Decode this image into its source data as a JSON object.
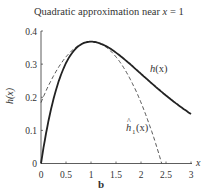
{
  "chart_data": {
    "type": "line",
    "title": "Quadratic approximation near x = 1",
    "title_prefix": "Quadratic approximation near ",
    "title_var": "x",
    "title_suffix": " = 1",
    "xlabel": "x",
    "ylabel": "h(x)",
    "panel_label": "b",
    "xlim": [
      0,
      3
    ],
    "ylim": [
      0,
      0.4
    ],
    "xticks": [
      "0",
      "0.5",
      "1",
      "1.5",
      "2",
      "2.5",
      "3"
    ],
    "yticks": [
      "0",
      "0.1",
      "0.2",
      "0.3",
      "0.4"
    ],
    "grid": false,
    "legend": "inline labels",
    "series": [
      {
        "name": "h(x)",
        "label": "h(x)",
        "style": "solid",
        "x": [
          0,
          0.1,
          0.2,
          0.3,
          0.4,
          0.5,
          0.6,
          0.7,
          0.8,
          0.9,
          1.0,
          1.2,
          1.4,
          1.6,
          1.8,
          2.0,
          2.2,
          2.4,
          2.6,
          2.8,
          3.0
        ],
        "values": [
          0,
          0.09,
          0.164,
          0.222,
          0.268,
          0.303,
          0.329,
          0.348,
          0.359,
          0.366,
          0.368,
          0.361,
          0.345,
          0.323,
          0.298,
          0.271,
          0.244,
          0.218,
          0.193,
          0.17,
          0.149
        ]
      },
      {
        "name": "ĥ1(x)",
        "label": "ĥ1(x)",
        "style": "dashed",
        "x": [
          0,
          0.2,
          0.4,
          0.6,
          0.8,
          1.0,
          1.2,
          1.4,
          1.6,
          1.8,
          2.0,
          2.2,
          2.4,
          2.414
        ],
        "values": [
          0.184,
          0.25,
          0.302,
          0.339,
          0.361,
          0.368,
          0.361,
          0.339,
          0.302,
          0.25,
          0.184,
          0.103,
          0.007,
          0
        ]
      }
    ],
    "annotations": [
      {
        "text": "h(x)",
        "x": 2.35,
        "y": 0.285
      },
      {
        "text": "ĥ1(x)",
        "x": 1.65,
        "y": 0.105
      }
    ]
  },
  "labels": {
    "hx_main": "h",
    "hx_arg": "(x)",
    "hhat_main": "h",
    "hhat_sub": "1",
    "hhat_arg": "(x)",
    "hat": "^"
  }
}
